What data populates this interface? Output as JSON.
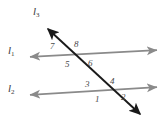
{
  "figure": {
    "width": 168,
    "height": 127,
    "background": "#ffffff"
  },
  "colors": {
    "parallel_lines": "#8a8a8a",
    "transversal": "#1a1a1a",
    "label_text": "#3a3a3a",
    "angle_text": "#4a4a4a"
  },
  "lines": [
    {
      "id": "l1",
      "label": "l",
      "subscript": "1",
      "color": "#8a8a8a",
      "arrowheads": "both",
      "x1": 26,
      "y1": 57,
      "x2": 161,
      "y2": 50,
      "label_x": 8,
      "label_y": 45
    },
    {
      "id": "l2",
      "label": "l",
      "subscript": "2",
      "color": "#8a8a8a",
      "arrowheads": "both",
      "x1": 26,
      "y1": 95,
      "x2": 161,
      "y2": 87,
      "label_x": 8,
      "label_y": 83
    },
    {
      "id": "l3",
      "label": "l",
      "subscript": "3",
      "color": "#1a1a1a",
      "arrowheads": "both",
      "x1": 44,
      "y1": 25,
      "x2": 144,
      "y2": 118,
      "label_x": 33,
      "label_y": 6
    }
  ],
  "intersections": [
    {
      "id": "upper",
      "line": "l1",
      "x": 70,
      "y": 54
    },
    {
      "id": "lower",
      "line": "l2",
      "x": 104,
      "y": 91
    }
  ],
  "angles": [
    {
      "number": "1",
      "x": 95,
      "y": 95,
      "intersection": "lower",
      "position": "below-left"
    },
    {
      "number": "2",
      "x": 121,
      "y": 93,
      "intersection": "lower",
      "position": "below-right"
    },
    {
      "number": "3",
      "x": 85,
      "y": 80,
      "intersection": "lower",
      "position": "above-left"
    },
    {
      "number": "4",
      "x": 110,
      "y": 77,
      "intersection": "lower",
      "position": "above-right"
    },
    {
      "number": "5",
      "x": 65,
      "y": 60,
      "intersection": "upper",
      "position": "below-left"
    },
    {
      "number": "6",
      "x": 88,
      "y": 59,
      "intersection": "upper",
      "position": "below-right"
    },
    {
      "number": "7",
      "x": 50,
      "y": 42,
      "intersection": "upper",
      "position": "above-left"
    },
    {
      "number": "8",
      "x": 74,
      "y": 40,
      "intersection": "upper",
      "position": "above-right"
    }
  ]
}
